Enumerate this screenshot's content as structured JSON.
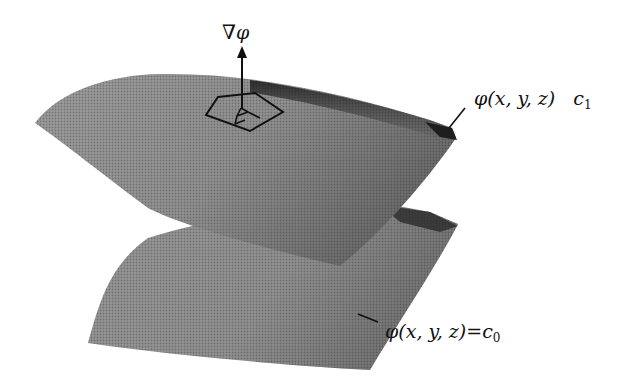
{
  "figure": {
    "gradient_label": {
      "symbol": "∇",
      "variable": "φ"
    },
    "upper_surface": {
      "label": "φ(x, y, z)",
      "equals": "",
      "constant": "c",
      "subscript": "1"
    },
    "lower_surface": {
      "label": "φ(x, y, z)",
      "equals": "=",
      "constant": "c",
      "subscript": "0"
    },
    "colors": {
      "surface_fill": "#9a9a9a",
      "surface_dark_edge": "#2a2a2a",
      "ink": "#111111",
      "background": "#ffffff"
    }
  }
}
